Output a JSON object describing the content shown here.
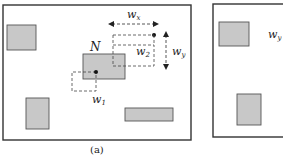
{
  "figure": {
    "panels": [
      {
        "id": "a",
        "caption": "(a)",
        "labels": {
          "node": "N",
          "w1": "w",
          "w1_sub": "1",
          "w2": "w",
          "w2_sub": "2",
          "wx": "w",
          "wx_sub": "x",
          "wy": "w",
          "wy_sub": "y"
        }
      },
      {
        "id": "b",
        "labels": {
          "wy": "w",
          "wy_sub": "y"
        }
      }
    ],
    "colors": {
      "frame": "#333333",
      "rect_fill": "#c8c8c8",
      "rect_stroke": "#555555",
      "dash": "#444444"
    }
  }
}
